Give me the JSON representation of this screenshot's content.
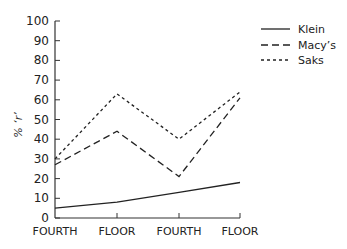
{
  "chart_data": {
    "type": "line",
    "title": "",
    "xlabel": "",
    "ylabel": "% 'r'",
    "categories": [
      "FOURTH",
      "FLOOR",
      "FOURTH",
      "FLOOR"
    ],
    "ylim": [
      0,
      100
    ],
    "yticks": [
      0,
      10,
      20,
      30,
      40,
      50,
      60,
      70,
      80,
      90,
      100
    ],
    "grid": false,
    "legend_position": "top-right",
    "series": [
      {
        "name": "Klein",
        "style": "solid",
        "values": [
          5,
          8,
          13,
          18
        ]
      },
      {
        "name": "Macy's",
        "style": "long-dash",
        "values": [
          27,
          44,
          21,
          61
        ]
      },
      {
        "name": "Saks",
        "style": "short-dash",
        "values": [
          30,
          63,
          40,
          64
        ]
      }
    ]
  },
  "legend": {
    "items": [
      {
        "label": "Klein"
      },
      {
        "label": "Macy’s"
      },
      {
        "label": "Saks"
      }
    ]
  },
  "axis": {
    "ylabel": "% ‘r’"
  }
}
